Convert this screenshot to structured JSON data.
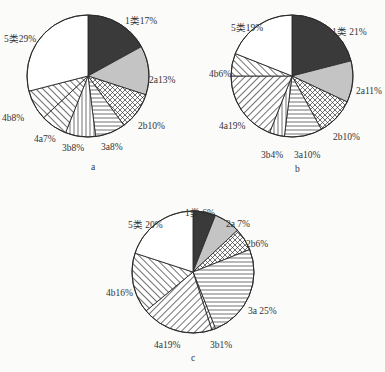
{
  "chart_data": [
    {
      "type": "pie",
      "title": "a",
      "center": [
        88,
        76
      ],
      "radius": 61,
      "slices": [
        {
          "label": "1类",
          "value": 17,
          "pattern": "dark"
        },
        {
          "label": "2a",
          "value": 13,
          "pattern": "gray"
        },
        {
          "label": "2b",
          "value": 10,
          "pattern": "crosshatch"
        },
        {
          "label": "3a",
          "value": 8,
          "pattern": "horizontal"
        },
        {
          "label": "3b",
          "value": 8,
          "pattern": "vertical"
        },
        {
          "label": "4a",
          "value": 7,
          "pattern": "diag-right"
        },
        {
          "label": "4b",
          "value": 8,
          "pattern": "diag-right"
        },
        {
          "label": "5类",
          "value": 29,
          "pattern": "white"
        }
      ],
      "label_text": [
        "1类17%",
        "2a13%",
        "2b10%",
        "3a8%",
        "3b8%",
        "4a7%",
        "4b8%",
        "5类29%"
      ],
      "label_pos": [
        [
          125,
          15
        ],
        [
          149,
          74
        ],
        [
          138,
          120
        ],
        [
          101,
          141
        ],
        [
          62,
          142
        ],
        [
          34,
          133
        ],
        [
          2,
          112
        ],
        [
          4,
          33
        ]
      ]
    },
    {
      "type": "pie",
      "title": "b",
      "center": [
        292,
        76
      ],
      "radius": 61,
      "slices": [
        {
          "label": "1类",
          "value": 21,
          "pattern": "dark"
        },
        {
          "label": "2a",
          "value": 11,
          "pattern": "gray"
        },
        {
          "label": "2b",
          "value": 10,
          "pattern": "crosshatch"
        },
        {
          "label": "3a",
          "value": 10,
          "pattern": "horizontal"
        },
        {
          "label": "3b",
          "value": 4,
          "pattern": "vertical"
        },
        {
          "label": "4a",
          "value": 19,
          "pattern": "diag-left"
        },
        {
          "label": "4b",
          "value": 6,
          "pattern": "diag-right"
        },
        {
          "label": "5类",
          "value": 19,
          "pattern": "white"
        }
      ],
      "label_text": [
        "1类 21%",
        "2a11%",
        "2b10%",
        "3a10%",
        "3b4%",
        "4a19%",
        "4b6%",
        "5类19%"
      ],
      "label_pos": [
        [
          332,
          26
        ],
        [
          356,
          85
        ],
        [
          333,
          131
        ],
        [
          294,
          149
        ],
        [
          261,
          149
        ],
        [
          219,
          120
        ],
        [
          209,
          68
        ],
        [
          231,
          22
        ]
      ]
    },
    {
      "type": "pie",
      "title": "c",
      "center": [
        193,
        272
      ],
      "radius": 61,
      "slices": [
        {
          "label": "1类",
          "value": 6,
          "pattern": "dark"
        },
        {
          "label": "2a",
          "value": 7,
          "pattern": "gray"
        },
        {
          "label": "2b",
          "value": 6,
          "pattern": "crosshatch"
        },
        {
          "label": "3a",
          "value": 25,
          "pattern": "horizontal"
        },
        {
          "label": "3b",
          "value": 1,
          "pattern": "diag-left"
        },
        {
          "label": "4a",
          "value": 19,
          "pattern": "diag-left"
        },
        {
          "label": "4b",
          "value": 16,
          "pattern": "diag-right"
        },
        {
          "label": "5类",
          "value": 20,
          "pattern": "white"
        }
      ],
      "label_text": [
        "1类 6%",
        "2a 7%",
        "2b6%",
        "3a 25%",
        "3b1%",
        "4a19%",
        "4b16%",
        "5类 20%"
      ],
      "label_pos": [
        [
          185,
          207
        ],
        [
          226,
          218
        ],
        [
          246,
          238
        ],
        [
          248,
          305
        ],
        [
          210,
          339
        ],
        [
          154,
          339
        ],
        [
          106,
          287
        ],
        [
          128,
          219
        ]
      ]
    }
  ],
  "captions": [
    "a",
    "b",
    "c"
  ],
  "caption_pos": [
    [
      91,
      170
    ],
    [
      295,
      172
    ],
    [
      191,
      361
    ]
  ],
  "colors": {
    "dark": "#3a3a3a",
    "gray": "#c4c4c4",
    "line": "#2a2a2a",
    "bg": "#fbfbfa"
  }
}
